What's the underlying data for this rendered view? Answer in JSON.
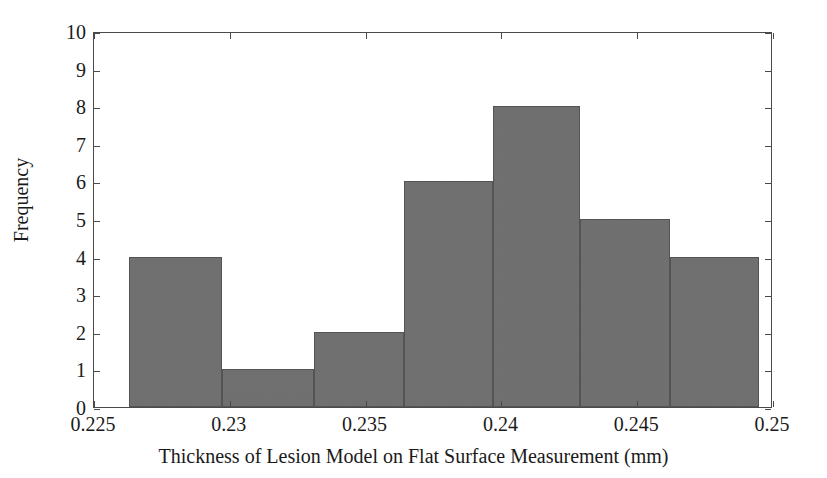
{
  "chart_data": {
    "type": "bar",
    "title": "",
    "subtitle": "",
    "xlabel": "Thickness of Lesion Model on Flat Surface Measurement (mm)",
    "ylabel": "Frequency",
    "xlim": [
      0.225,
      0.25
    ],
    "ylim": [
      0,
      10
    ],
    "grid": false,
    "legend": null,
    "xticks": [
      "0.225",
      "0.23",
      "0.235",
      "0.24",
      "0.245",
      "0.25"
    ],
    "xtick_values": [
      0.225,
      0.23,
      0.235,
      0.24,
      0.245,
      0.25
    ],
    "yticks": [
      "0",
      "1",
      "2",
      "3",
      "4",
      "5",
      "6",
      "7",
      "8",
      "9",
      "10"
    ],
    "ytick_values": [
      0,
      1,
      2,
      3,
      4,
      5,
      6,
      7,
      8,
      9,
      10
    ],
    "bin_edges": [
      0.2263,
      0.2297,
      0.2331,
      0.2364,
      0.2397,
      0.2429,
      0.2462,
      0.2495
    ],
    "categories": [
      "0.2263-0.2297",
      "0.2297-0.2331",
      "0.2331-0.2364",
      "0.2364-0.2397",
      "0.2397-0.2429",
      "0.2429-0.2462",
      "0.2462-0.2495"
    ],
    "values": [
      4,
      1,
      2,
      6,
      8,
      5,
      4
    ],
    "bar_color": "#6f6f6f",
    "bar_edge_color": "#545454",
    "axis_color": "#4a4a4a",
    "background_color": "#ffffff"
  },
  "figure": {
    "axis_title_x": "Thickness of Lesion Model on Flat Surface Measurement (mm)",
    "axis_title_y": "Frequency"
  }
}
